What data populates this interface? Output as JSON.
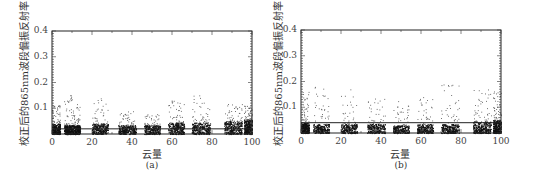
{
  "chart_data": [
    {
      "type": "scatter",
      "panel": "a",
      "caption": "(a)",
      "xlabel": "云量",
      "ylabel": "校正后的865nm波段偏振反射率",
      "xlim": [
        0,
        100
      ],
      "ylim": [
        0,
        0.4
      ],
      "xticks": [
        "0",
        "20",
        "40",
        "60",
        "80",
        "100"
      ],
      "yticks": [
        "0.1",
        "0.2",
        "0.3",
        "0.4"
      ],
      "reference_line_y": 0.02,
      "clusters": [
        {
          "x": [
            0,
            4
          ],
          "dense_max": 0.04,
          "sparse_max": 0.12,
          "density": 1.0
        },
        {
          "x": [
            6,
            10
          ],
          "dense_max": 0.035,
          "sparse_max": 0.155,
          "density": 0.9
        },
        {
          "x": [
            10,
            14
          ],
          "dense_max": 0.035,
          "sparse_max": 0.12,
          "density": 0.8
        },
        {
          "x": [
            20,
            28
          ],
          "dense_max": 0.04,
          "sparse_max": 0.14,
          "density": 0.9
        },
        {
          "x": [
            33,
            42
          ],
          "dense_max": 0.035,
          "sparse_max": 0.09,
          "density": 0.9
        },
        {
          "x": [
            46,
            54
          ],
          "dense_max": 0.035,
          "sparse_max": 0.08,
          "density": 0.85
        },
        {
          "x": [
            58,
            66
          ],
          "dense_max": 0.045,
          "sparse_max": 0.13,
          "density": 0.95
        },
        {
          "x": [
            70,
            79
          ],
          "dense_max": 0.045,
          "sparse_max": 0.16,
          "density": 0.95
        },
        {
          "x": [
            86,
            95
          ],
          "dense_max": 0.05,
          "sparse_max": 0.12,
          "density": 1.0
        },
        {
          "x": [
            96,
            100
          ],
          "dense_max": 0.055,
          "sparse_max": 0.11,
          "density": 1.0
        }
      ]
    },
    {
      "type": "scatter",
      "panel": "b",
      "caption": "(b)",
      "xlabel": "云量",
      "ylabel": "校正后的865nm波段偏振反射率",
      "xlim": [
        0,
        100
      ],
      "ylim": [
        0,
        0.4
      ],
      "xticks": [
        "0",
        "20",
        "40",
        "60",
        "80",
        "100"
      ],
      "yticks": [
        "0.1",
        "0.2",
        "0.3",
        "0.4"
      ],
      "reference_line_y": 0.04,
      "clusters": [
        {
          "x": [
            0,
            4
          ],
          "dense_max": 0.04,
          "sparse_max": 0.16,
          "density": 1.0
        },
        {
          "x": [
            6,
            14
          ],
          "dense_max": 0.035,
          "sparse_max": 0.18,
          "density": 0.8
        },
        {
          "x": [
            20,
            28
          ],
          "dense_max": 0.035,
          "sparse_max": 0.18,
          "density": 0.75
        },
        {
          "x": [
            33,
            42
          ],
          "dense_max": 0.035,
          "sparse_max": 0.14,
          "density": 0.8
        },
        {
          "x": [
            46,
            54
          ],
          "dense_max": 0.03,
          "sparse_max": 0.17,
          "density": 0.75
        },
        {
          "x": [
            58,
            66
          ],
          "dense_max": 0.035,
          "sparse_max": 0.14,
          "density": 0.8
        },
        {
          "x": [
            70,
            79
          ],
          "dense_max": 0.035,
          "sparse_max": 0.19,
          "density": 0.85
        },
        {
          "x": [
            86,
            95
          ],
          "dense_max": 0.045,
          "sparse_max": 0.17,
          "density": 1.0
        },
        {
          "x": [
            96,
            100
          ],
          "dense_max": 0.05,
          "sparse_max": 0.17,
          "density": 1.0
        }
      ]
    }
  ]
}
